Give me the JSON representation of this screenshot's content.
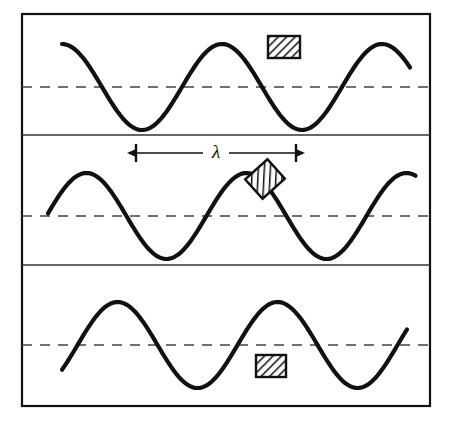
{
  "figure": {
    "type": "physics-wave-diagram",
    "background_color": "#ffffff",
    "ink_color": "#111111",
    "frame": {
      "x": 22,
      "y": 14,
      "width": 408,
      "height": 392,
      "border_width": 2.2,
      "border_color": "#111111"
    },
    "dividers": [
      {
        "name": "divider-1",
        "y": 135
      },
      {
        "name": "divider-2",
        "y": 265
      }
    ],
    "divider_width": 1.4
  },
  "annotation": {
    "wavelength_symbol": "λ",
    "arrow": {
      "y": 153,
      "x_left": 136,
      "x_right": 296,
      "tick_half_height": 9,
      "label_gap_half": 13
    }
  },
  "chart_data": {
    "type": "line",
    "xlabel": "",
    "ylabel": "",
    "grid": false,
    "legend": null,
    "annotations": [
      {
        "text": "λ",
        "meaning": "wavelength",
        "x_start": 136,
        "x_end": 296,
        "measured_length_px": 160
      }
    ],
    "common": {
      "wavelength_px": 160,
      "amplitude_px": 43,
      "stroke_width": 4.2,
      "dash_pattern": "10 8",
      "dash_width": 1.6
    },
    "panels": [
      {
        "name": "panel-top",
        "index": 0,
        "label": "t = 0",
        "centerline_y": 87,
        "baseline_y": 87,
        "amplitude": 43,
        "phase_deg": 0,
        "x_start": 62,
        "x_end": 410,
        "crest_positions_x": [
          110,
          270
        ],
        "trough_positions_x": [
          190,
          350
        ],
        "marker": {
          "name": "float-block-top",
          "x": 268,
          "y": 36,
          "width": 32,
          "height": 22,
          "rotation_deg": 0,
          "fill": "hatched",
          "state": "at-crest"
        }
      },
      {
        "name": "panel-middle",
        "index": 1,
        "label": "t = T/4",
        "centerline_y": 216,
        "baseline_y": 216,
        "amplitude": 43,
        "phase_deg": -55,
        "x_start": 48,
        "x_end": 416,
        "crest_positions_x": [
          136,
          296
        ],
        "trough_positions_x": [
          216,
          376
        ],
        "marker": {
          "name": "float-block-middle",
          "x": 250,
          "y": 166,
          "width": 30,
          "height": 26,
          "rotation_deg": -42,
          "fill": "hatched",
          "state": "on-rising-slope"
        }
      },
      {
        "name": "panel-bottom",
        "index": 2,
        "label": "t = T/2",
        "centerline_y": 345,
        "baseline_y": 345,
        "amplitude": 43,
        "phase_deg": -125,
        "x_start": 62,
        "x_end": 408,
        "crest_positions_x": [
          190,
          350
        ],
        "trough_positions_x": [
          110,
          270
        ],
        "marker": {
          "name": "float-block-bottom",
          "x": 256,
          "y": 355,
          "width": 30,
          "height": 22,
          "rotation_deg": 0,
          "fill": "hatched",
          "state": "at-trough"
        }
      }
    ]
  }
}
